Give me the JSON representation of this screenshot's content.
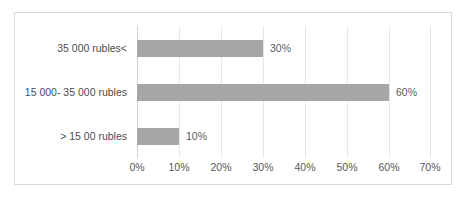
{
  "chart_data": {
    "type": "bar",
    "orientation": "horizontal",
    "title": "",
    "xlabel": "",
    "ylabel": "",
    "categories": [
      "35 000 rubles<",
      "15 000- 35 000 rubles",
      "> 15 00 rubles"
    ],
    "values": [
      30,
      60,
      10
    ],
    "data_labels": [
      "30%",
      "60%",
      "10%"
    ],
    "xlim": [
      0,
      70
    ],
    "x_tick_values": [
      0,
      10,
      20,
      30,
      40,
      50,
      60,
      70
    ],
    "x_tick_labels": [
      "0%",
      "10%",
      "20%",
      "30%",
      "40%",
      "50%",
      "60%",
      "70%"
    ],
    "grid": true,
    "legend": false,
    "bar_color": "#a6a6a6",
    "gridline_color": "#e6e6e6",
    "border_color": "#d9d9d9",
    "text_color": "#4d4d4d",
    "series": [
      {
        "name": "",
        "values": [
          30,
          60,
          10
        ]
      }
    ]
  }
}
